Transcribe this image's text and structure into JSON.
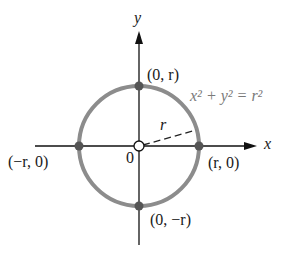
{
  "axes": {
    "x_label": "x",
    "y_label": "y",
    "origin_label": "0"
  },
  "circle": {
    "equation": "x² + y² = r²",
    "radius_label": "r",
    "stroke_color": "#8c8c8c",
    "center": [
      0,
      0
    ]
  },
  "points": {
    "top": "(0, r)",
    "bottom": "(0, −r)",
    "left": "(−r, 0)",
    "right": "(r, 0)"
  }
}
